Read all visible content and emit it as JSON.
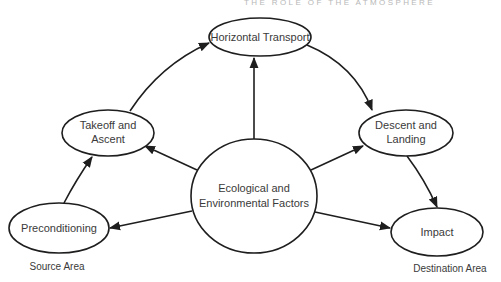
{
  "header": {
    "text": "THE ROLE OF THE ATMOSPHERE"
  },
  "nodes": {
    "horizontal_transport": {
      "lines": [
        "Horizontal Transport"
      ]
    },
    "takeoff_ascent": {
      "lines": [
        "Takeoff and",
        "Ascent"
      ]
    },
    "descent_landing": {
      "lines": [
        "Descent and",
        "Landing"
      ]
    },
    "ecological": {
      "lines": [
        "Ecological and",
        "Environmental Factors"
      ]
    },
    "preconditioning": {
      "lines": [
        "Preconditioning"
      ]
    },
    "impact": {
      "lines": [
        "Impact"
      ]
    }
  },
  "areas": {
    "source": "Source Area",
    "destination": "Destination Area"
  },
  "edges": [
    {
      "from": "Preconditioning",
      "to": "Takeoff and Ascent"
    },
    {
      "from": "Takeoff and Ascent",
      "to": "Horizontal Transport"
    },
    {
      "from": "Horizontal Transport",
      "to": "Descent and Landing"
    },
    {
      "from": "Descent and Landing",
      "to": "Impact"
    },
    {
      "from": "Ecological and Environmental Factors",
      "to": "Horizontal Transport"
    },
    {
      "from": "Ecological and Environmental Factors",
      "to": "Takeoff and Ascent"
    },
    {
      "from": "Ecological and Environmental Factors",
      "to": "Descent and Landing"
    },
    {
      "from": "Ecological and Environmental Factors",
      "to": "Preconditioning"
    },
    {
      "from": "Ecological and Environmental Factors",
      "to": "Impact"
    }
  ],
  "colors": {
    "stroke": "#1e1e1e",
    "text": "#3a3a3a",
    "background": "#ffffff"
  }
}
